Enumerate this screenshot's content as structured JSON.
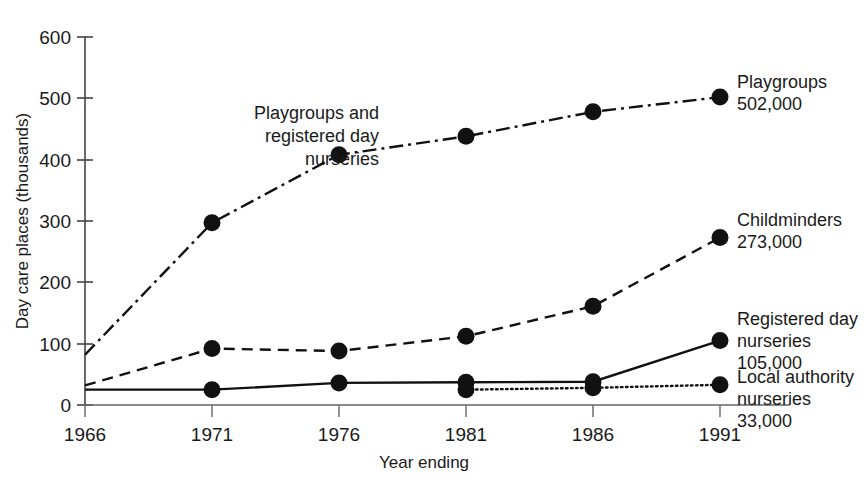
{
  "chart_data": {
    "type": "line",
    "title": "",
    "xlabel": "Year ending",
    "ylabel": "Day care places (thousands)",
    "categories": [
      "1966",
      "1971",
      "1976",
      "1981",
      "1986",
      "1991"
    ],
    "x": [
      1966,
      1971,
      1976,
      1981,
      1986,
      1991
    ],
    "xlim": [
      1966,
      1991
    ],
    "ylim": [
      0,
      600
    ],
    "yticks": [
      "0",
      "100",
      "200",
      "300",
      "400",
      "500",
      "600"
    ],
    "ytick_values": [
      0,
      100,
      200,
      300,
      400,
      500,
      600
    ],
    "grid": false,
    "legend_position": "right-of-plot-inline-labels",
    "series": [
      {
        "name": "Playgroups",
        "linestyle": "dash-dot",
        "color": "#111111",
        "values": [
          82,
          297,
          408,
          438,
          478,
          502
        ],
        "markers_at": [
          1971,
          1976,
          1981,
          1986,
          1991
        ],
        "end_label": "Playgroups",
        "end_value_label": "502,000"
      },
      {
        "name": "Childminders",
        "linestyle": "dashed",
        "color": "#111111",
        "values": [
          32,
          92,
          88,
          112,
          161,
          273
        ],
        "markers_at": [
          1971,
          1976,
          1981,
          1986,
          1991
        ],
        "end_label": "Childminders",
        "end_value_label": "273,000"
      },
      {
        "name": "Registered day nurseries",
        "linestyle": "solid",
        "color": "#111111",
        "values": [
          25,
          25,
          36,
          37,
          38,
          105
        ],
        "markers_at": [
          1971,
          1976,
          1981,
          1986,
          1991
        ],
        "end_label": "Registered day nurseries",
        "end_value_label": "105,000"
      },
      {
        "name": "Local authority nurseries",
        "linestyle": "dotted",
        "color": "#111111",
        "values": [
          null,
          null,
          null,
          25,
          28,
          33
        ],
        "markers_at": [
          1981,
          1986,
          1991
        ],
        "end_label": "Local authority nurseries",
        "end_value_label": "33,000"
      }
    ],
    "annotations": [
      {
        "name": "playgroups-and-registered-day-nurseries-note",
        "lines": [
          "Playgroups and",
          "registered day",
          "nurseries"
        ]
      }
    ]
  },
  "axes": {
    "y_title": "Day care places (thousands)",
    "x_title": "Year ending",
    "y_ticks": [
      "600",
      "500",
      "400",
      "300",
      "200",
      "100",
      "0"
    ],
    "x_ticks": [
      "1966",
      "1971",
      "1976",
      "1981",
      "1986",
      "1991"
    ]
  },
  "annotation": {
    "line1": "Playgroups and",
    "line2": "registered day",
    "line3": "nurseries"
  },
  "labels": {
    "playgroups_name": "Playgroups",
    "playgroups_value": "502,000",
    "childminders_name": "Childminders",
    "childminders_value": "273,000",
    "registered_name_l1": "Registered day",
    "registered_name_l2": "nurseries",
    "registered_value": "105,000",
    "local_name_l1": "Local authority",
    "local_name_l2": "nurseries",
    "local_value": "33,000"
  },
  "colors": {
    "ink": "#1a1a1a",
    "line": "#111111",
    "axis": "#555555"
  }
}
